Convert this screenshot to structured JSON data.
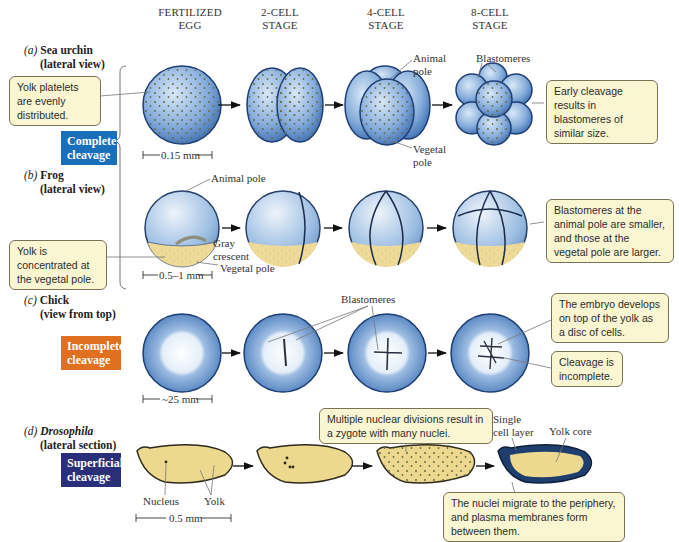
{
  "stages": [
    {
      "line1": "FERTILIZED",
      "line2": "EGG"
    },
    {
      "line1": "2-CELL",
      "line2": "STAGE"
    },
    {
      "line1": "4-CELL",
      "line2": "STAGE"
    },
    {
      "line1": "8-CELL",
      "line2": "STAGE"
    }
  ],
  "rows": {
    "a": {
      "letter": "(a)",
      "name": "Sea urchin",
      "view": "(lateral view)",
      "scale": "0.15 mm",
      "notes": {
        "left": "Yolk platelets are evenly distributed.",
        "right": "Early cleavage results in blastomeres of similar size."
      },
      "labels": {
        "animal_pole": "Animal pole",
        "vegetal_pole": "Vegetal pole",
        "blastomeres": "Blastomeres"
      }
    },
    "b": {
      "letter": "(b)",
      "name": "Frog",
      "view": "(lateral view)",
      "scale": "0.5–1 mm",
      "notes": {
        "left": "Yolk is concentrated at the vegetal pole.",
        "right": "Blastomeres at the animal pole are smaller, and those at the vegetal pole are larger."
      },
      "labels": {
        "animal_pole": "Animal pole",
        "gray_crescent": "Gray crescent",
        "vegetal_pole": "Vegetal pole"
      }
    },
    "c": {
      "letter": "(c)",
      "name": "Chick",
      "view": "(view from top)",
      "scale": "~25 mm",
      "notes": {
        "top": "The embryo develops on top of the yolk as a disc of cells.",
        "bottom": "Cleavage is incomplete."
      },
      "labels": {
        "blastomeres": "Blastomeres"
      }
    },
    "d": {
      "letter": "(d)",
      "name": "Drosophila",
      "view": "(lateral section)",
      "scale": "0.5 mm",
      "notes": {
        "top": "Multiple nuclear divisions result in a zygote with many nuclei.",
        "bottom": "The nuclei migrate to the periphery, and plasma membranes form between them."
      },
      "labels": {
        "nucleus": "Nucleus",
        "yolk": "Yolk",
        "single_cell_layer": "Single cell layer",
        "yolk_core": "Yolk core"
      }
    }
  },
  "tags": {
    "complete": {
      "line1": "Complete",
      "line2": "cleavage",
      "color": "#1a6fba"
    },
    "incomplete": {
      "line1": "Incomplete",
      "line2": "cleavage",
      "color": "#e07020"
    },
    "superficial": {
      "line1": "Superficial",
      "line2": "cleavage",
      "color": "#2a2f7a"
    }
  },
  "colors": {
    "embryo_blue": "#6f9fd4",
    "yolk": "#ecd98f",
    "note_bg": "#fbf6d2"
  }
}
